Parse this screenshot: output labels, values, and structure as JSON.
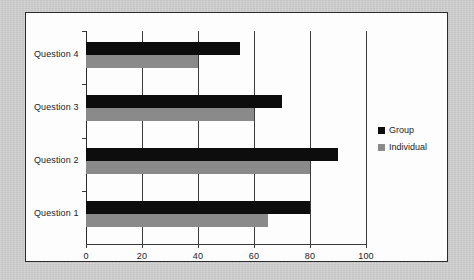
{
  "colors": {
    "page_background": "#c9c9c9",
    "panel_background": "#fdfdfd",
    "panel_border": "#2b2b2b",
    "axis": "#3a3a3a",
    "group_series": "#0d0d0d",
    "individual_series": "#8a8a8a",
    "text": "#1c1c1c"
  },
  "chart_data": {
    "type": "bar",
    "orientation": "horizontal",
    "title": "",
    "xlabel": "",
    "ylabel": "",
    "categories": [
      "Question 1",
      "Question 2",
      "Question 3",
      "Question 4"
    ],
    "category_order_top_to_bottom": [
      "Question 4",
      "Question 3",
      "Question 2",
      "Question 1"
    ],
    "series": [
      {
        "name": "Group",
        "color": "#0d0d0d",
        "values": [
          80,
          90,
          70,
          55
        ]
      },
      {
        "name": "Individual",
        "color": "#8a8a8a",
        "values": [
          65,
          80,
          60,
          40
        ]
      }
    ],
    "xlim": [
      0,
      100
    ],
    "xticks": [
      0,
      20,
      40,
      60,
      80,
      100
    ],
    "xtick_labels": [
      "0",
      "20",
      "40",
      "60",
      "80",
      "100"
    ],
    "grid": true,
    "grid_axis": "x",
    "legend_position": "right",
    "legend_entries": [
      "Group",
      "Individual"
    ]
  }
}
